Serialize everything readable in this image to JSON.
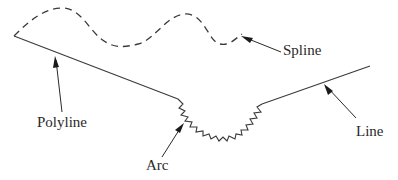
{
  "diagram": {
    "title": "",
    "labels": {
      "spline": "Spline",
      "polyline": "Polyline",
      "arc": "Arc",
      "line": "Line"
    },
    "colors": {
      "stroke": "#3a3a3a",
      "text": "#2a2a2a",
      "background": "#ffffff"
    },
    "entities": [
      {
        "type": "spline",
        "style": "dashed",
        "label": "Spline"
      },
      {
        "type": "polyline",
        "style": "solid",
        "label": "Polyline"
      },
      {
        "type": "arc",
        "style": "zigzag",
        "label": "Arc"
      },
      {
        "type": "line",
        "style": "solid",
        "label": "Line"
      }
    ]
  }
}
